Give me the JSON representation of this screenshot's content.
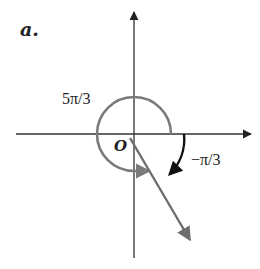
{
  "diagram": {
    "part_label": "a.",
    "origin_label": "O",
    "positive_angle_label": "5π/3",
    "negative_angle_label": "−π/3",
    "colors": {
      "axes": "#333333",
      "terminal_ray": "#6e6e6e",
      "positive_arc": "#7a7a7a",
      "negative_arc": "#111111",
      "background": "#ffffff"
    },
    "elements": [
      {
        "name": "x-axis",
        "type": "axis",
        "direction": "horizontal",
        "arrow": "right"
      },
      {
        "name": "y-axis",
        "type": "axis",
        "direction": "vertical",
        "arrow": "up"
      },
      {
        "name": "terminal-ray",
        "type": "ray",
        "angle": "−π/3"
      },
      {
        "name": "positive-arc",
        "type": "arc",
        "angle": "5π/3",
        "direction": "counterclockwise"
      },
      {
        "name": "negative-arc",
        "type": "arc",
        "angle": "−π/3",
        "direction": "clockwise"
      }
    ]
  }
}
